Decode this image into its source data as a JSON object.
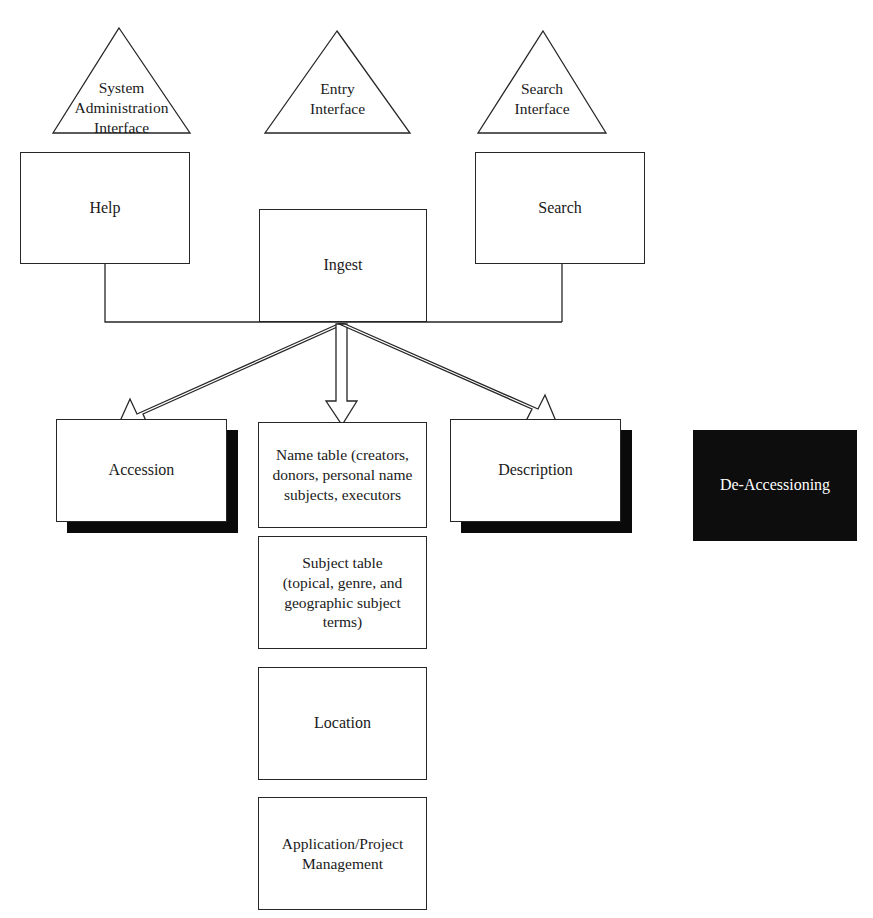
{
  "diagram": {
    "colors": {
      "stroke": "#262626",
      "fill": "#ffffff",
      "shadow": "#0a0a0a",
      "dark_fill": "#0d0d0d",
      "dark_text": "#ffffff"
    },
    "interfaces": [
      {
        "id": "system-administration-interface",
        "label": "System\nAdministration\nInterface"
      },
      {
        "id": "entry-interface",
        "label": "Entry\nInterface"
      },
      {
        "id": "search-interface",
        "label": "Search\nInterface"
      }
    ],
    "modules": [
      {
        "id": "help",
        "label": "Help"
      },
      {
        "id": "ingest",
        "label": "Ingest"
      },
      {
        "id": "search",
        "label": "Search"
      }
    ],
    "entities": [
      {
        "id": "accession",
        "label": "Accession",
        "shadow": true
      },
      {
        "id": "name-table",
        "label": "Name table (creators,\ndonors, personal name\nsubjects, executors",
        "shadow": false
      },
      {
        "id": "description",
        "label": "Description",
        "shadow": true
      }
    ],
    "tables": [
      {
        "id": "subject-table",
        "label": "Subject table\n(topical, genre, and\ngeographic subject terms)"
      },
      {
        "id": "location",
        "label": "Location"
      },
      {
        "id": "application-project-management",
        "label": "Application/Project\nManagement"
      }
    ],
    "standalone": [
      {
        "id": "de-accessioning",
        "label": "De-Accessioning"
      }
    ],
    "connectors": {
      "ingest_to_accession": "arrow",
      "ingest_to_name_table": "arrow",
      "ingest_to_description": "arrow",
      "help_bus": "line",
      "search_bus": "line"
    }
  }
}
